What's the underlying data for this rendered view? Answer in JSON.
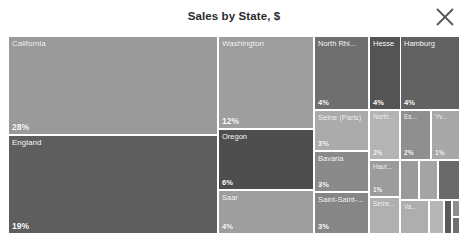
{
  "header": {
    "title": "Sales by State, $",
    "close_icon": "close-icon",
    "close_label": "Close"
  },
  "chart_data": {
    "type": "treemap",
    "title": "Sales by State, $",
    "value_format": "percent",
    "grid": false,
    "legend": "none",
    "colorscale": "grayscale",
    "tiles": [
      {
        "label": "California",
        "value": "28%",
        "pct": 28,
        "color": "#9a9a9a",
        "x": 0.0,
        "y": 0.0,
        "w": 0.4646,
        "h": 0.5,
        "size": "big"
      },
      {
        "label": "England",
        "value": "19%",
        "pct": 19,
        "color": "#5e5e5e",
        "x": 0.0,
        "y": 0.5,
        "w": 0.4646,
        "h": 0.5,
        "size": "big"
      },
      {
        "label": "Washington",
        "value": "12%",
        "pct": 12,
        "color": "#9e9e9e",
        "x": 0.4646,
        "y": 0.0,
        "w": 0.2124,
        "h": 0.4697,
        "size": "big"
      },
      {
        "label": "Oregon",
        "value": "6%",
        "pct": 6,
        "color": "#4e4e4e",
        "x": 0.4646,
        "y": 0.4697,
        "w": 0.2124,
        "h": 0.3081,
        "size": "normal"
      },
      {
        "label": "Saar",
        "value": "4%",
        "pct": 4,
        "color": "#9e9e9e",
        "x": 0.4646,
        "y": 0.7778,
        "w": 0.2124,
        "h": 0.2222,
        "size": "normal"
      },
      {
        "label": "North Rhi...",
        "value": "4%",
        "pct": 4,
        "color": "#6f6f6f",
        "x": 0.677,
        "y": 0.0,
        "w": 0.1217,
        "h": 0.3737,
        "size": "normal"
      },
      {
        "label": "Seine (Paris)",
        "value": "3%",
        "pct": 3,
        "color": "#ababab",
        "x": 0.677,
        "y": 0.3737,
        "w": 0.1217,
        "h": 0.2071,
        "size": "normal"
      },
      {
        "label": "Bavaria",
        "value": "3%",
        "pct": 3,
        "color": "#8a8a8a",
        "x": 0.677,
        "y": 0.5808,
        "w": 0.1217,
        "h": 0.2071,
        "size": "normal"
      },
      {
        "label": "Saint-Saint-...",
        "value": "3%",
        "pct": 3,
        "color": "#868686",
        "x": 0.677,
        "y": 0.7879,
        "w": 0.1217,
        "h": 0.2121,
        "size": "normal"
      },
      {
        "label": "Hesse",
        "value": "4%",
        "pct": 4,
        "color": "#545454",
        "x": 0.7987,
        "y": 0.0,
        "w": 0.1018,
        "h": 0.3737,
        "size": "normal"
      },
      {
        "label": "North...",
        "value": "2%",
        "pct": 2,
        "color": "#b4b4b4",
        "x": 0.7987,
        "y": 0.3737,
        "w": 0.0686,
        "h": 0.2525,
        "size": "tiny"
      },
      {
        "label": "Haut...",
        "value": "1%",
        "pct": 1,
        "color": "#9c9c9c",
        "x": 0.7987,
        "y": 0.6262,
        "w": 0.0686,
        "h": 0.1869,
        "size": "tiny"
      },
      {
        "label": "Seine...",
        "value": "",
        "pct": 1,
        "color": "#b0b0b0",
        "x": 0.7987,
        "y": 0.8131,
        "w": 0.0686,
        "h": 0.1869,
        "size": "tiny"
      },
      {
        "label": "Hamburg",
        "value": "4%",
        "pct": 4,
        "color": "#626262",
        "x": 0.8673,
        "y": 0.0,
        "w": 0.1327,
        "h": 0.3737,
        "size": "normal"
      },
      {
        "label": "Es...",
        "value": "2%",
        "pct": 2,
        "color": "#8f8f8f",
        "x": 0.8673,
        "y": 0.3737,
        "w": 0.0686,
        "h": 0.2525,
        "size": "tiny"
      },
      {
        "label": "Yv...",
        "value": "1%",
        "pct": 1,
        "color": "#a8a8a8",
        "x": 0.9359,
        "y": 0.3737,
        "w": 0.0641,
        "h": 0.2525,
        "size": "tiny"
      },
      {
        "label": "",
        "value": "",
        "pct": 1,
        "color": "#9a9a9a",
        "x": 0.8673,
        "y": 0.6262,
        "w": 0.042,
        "h": 0.202,
        "size": "nolabel"
      },
      {
        "label": "",
        "value": "",
        "pct": 1,
        "color": "#a4a4a4",
        "x": 0.9093,
        "y": 0.6262,
        "w": 0.042,
        "h": 0.202,
        "size": "nolabel"
      },
      {
        "label": "",
        "value": "",
        "pct": 1,
        "color": "#6a6a6a",
        "x": 0.9513,
        "y": 0.6262,
        "w": 0.0487,
        "h": 0.202,
        "size": "nolabel"
      },
      {
        "label": "Va...",
        "value": "",
        "pct": 1,
        "color": "#aeaeae",
        "x": 0.8673,
        "y": 0.8282,
        "w": 0.0642,
        "h": 0.1718,
        "size": "tiny"
      },
      {
        "label": "",
        "value": "",
        "pct": 1,
        "color": "#b6b6b6",
        "x": 0.9315,
        "y": 0.8282,
        "w": 0.033,
        "h": 0.1718,
        "size": "nolabel"
      },
      {
        "label": "",
        "value": "",
        "pct": 1,
        "color": "#5a5a5a",
        "x": 0.9645,
        "y": 0.8282,
        "w": 0.0175,
        "h": 0.1718,
        "size": "nolabel"
      },
      {
        "label": "",
        "value": "",
        "pct": 1,
        "color": "#8e8e8e",
        "x": 0.982,
        "y": 0.8282,
        "w": 0.018,
        "h": 0.0859,
        "size": "nolabel"
      },
      {
        "label": "",
        "value": "",
        "pct": 1,
        "color": "#707070",
        "x": 0.982,
        "y": 0.9141,
        "w": 0.018,
        "h": 0.0859,
        "size": "nolabel"
      }
    ]
  }
}
